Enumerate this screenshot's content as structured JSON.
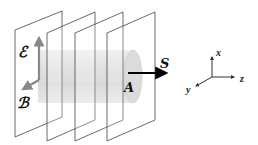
{
  "diagram": {
    "labels": {
      "electric_field": "ℰ",
      "magnetic_field": "ℬ",
      "poynting_vector": "S",
      "area": "A"
    },
    "axes": {
      "x": "x",
      "y": "y",
      "z": "z"
    },
    "plate_count": 4,
    "colors": {
      "plate_edge": "#444444",
      "cylinder": "#c8c8c8",
      "field_arrow": "#8a8a8a",
      "poynting_arrow": "#000000"
    }
  }
}
